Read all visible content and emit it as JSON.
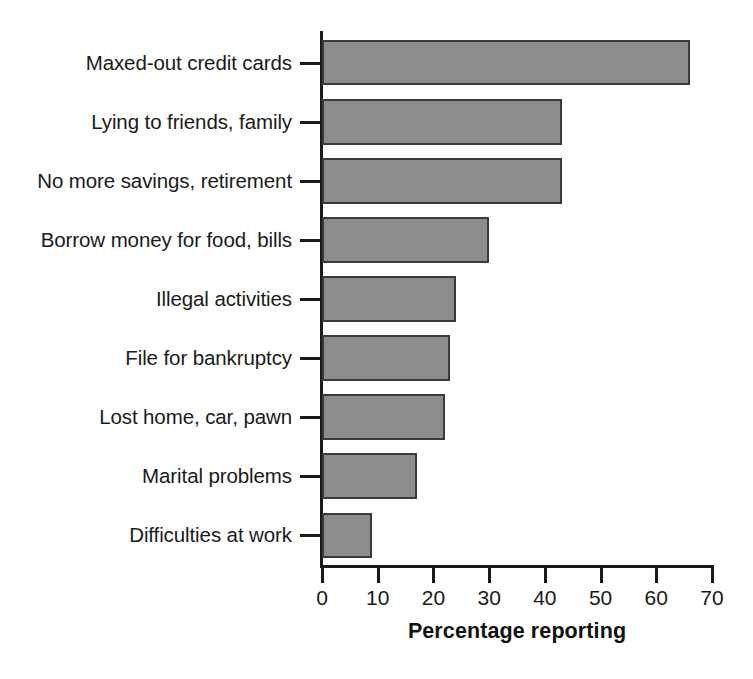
{
  "chart_data": {
    "type": "bar",
    "orientation": "horizontal",
    "title": "",
    "xlabel": "Percentage reporting",
    "ylabel": "",
    "xlim": [
      0,
      70
    ],
    "xticks": [
      0,
      10,
      20,
      30,
      40,
      50,
      60,
      70
    ],
    "grid": false,
    "legend": null,
    "categories": [
      "Maxed-out credit cards",
      "Lying to friends, family",
      "No more savings, retirement",
      "Borrow money for food, bills",
      "Illegal activities",
      "File for bankruptcy",
      "Lost home, car, pawn",
      "Marital problems",
      "Difficulties at work"
    ],
    "values": [
      66,
      43,
      43,
      30,
      24,
      23,
      22,
      17,
      9
    ],
    "bar_color": "#8c8c8c",
    "bar_edge_color": "#3a3a3a",
    "axis_color": "#1a1a1a",
    "background": "#ffffff"
  }
}
